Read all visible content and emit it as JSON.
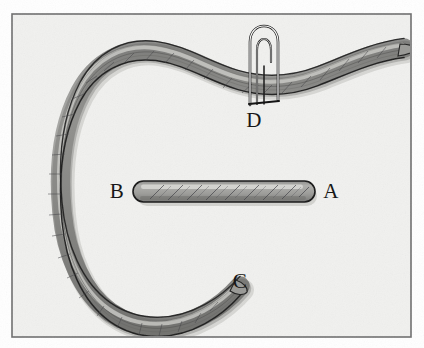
{
  "figure": {
    "kind": "scanned-line-drawing",
    "background_color": "#ffffff",
    "paper_color": "#f1f1ef",
    "frame": {
      "border_color": "#6e6e6e",
      "x": 12,
      "y": 14,
      "width": 399,
      "height": 323
    },
    "ink": {
      "outline_color": "#1c1c1c",
      "rope_fill_color": "#9b9b99",
      "rope_shadow_color": "#6f6f6d",
      "rope_highlight_color": "#d8d8d4",
      "strand_color": "#4a4a48",
      "pin_fill_color": "#fbfbfa"
    },
    "labels": [
      {
        "id": "label-a",
        "text": "A",
        "x": 331,
        "y": 198,
        "marks": "right end of horizontal rope segment"
      },
      {
        "id": "label-b",
        "text": "B",
        "x": 117,
        "y": 198,
        "marks": "left end of horizontal rope segment"
      },
      {
        "id": "label-c",
        "text": "C",
        "x": 240,
        "y": 288,
        "marks": "lower free end of curved rope"
      },
      {
        "id": "label-d",
        "text": "D",
        "x": 254,
        "y": 127,
        "marks": "pin piercing the curved rope"
      }
    ],
    "objects": [
      {
        "id": "curved-rope",
        "name": "curved-rope",
        "description": "long rope forming an open C arc, tapered tail exiting upper right, tapered free end at lower right of arc"
      },
      {
        "id": "straight-rope-segment",
        "name": "straight-rope-segment",
        "description": "short horizontal rope length with rounded ends, running from B on the left to A on the right"
      },
      {
        "id": "pin",
        "name": "pin",
        "description": "narrow hairpin with a rounded top loop and two parallel legs, passing through the rope near the top"
      }
    ]
  }
}
